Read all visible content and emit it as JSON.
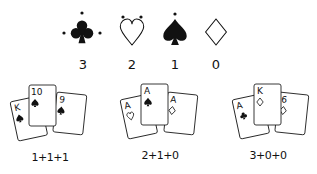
{
  "suits": [
    {
      "name": "clubs",
      "symbol": "♣",
      "filled": true,
      "dots": 3,
      "points": "3"
    },
    {
      "name": "hearts",
      "symbol": "♥",
      "filled": false,
      "dots": 2,
      "points": "2"
    },
    {
      "name": "spades",
      "symbol": "♠",
      "filled": true,
      "dots": 1,
      "points": "1"
    },
    {
      "name": "diamonds",
      "symbol": "♦",
      "filled": false,
      "dots": 0,
      "points": "0"
    }
  ],
  "hands": [
    {
      "label": "1+1+1",
      "cards": [
        {
          "rank": "K",
          "suit": "spades"
        },
        {
          "rank": "10",
          "suit": "spades"
        },
        {
          "rank": "9",
          "suit": "spades"
        }
      ]
    },
    {
      "label": "2+1+0",
      "cards": [
        {
          "rank": "A",
          "suit": "hearts"
        },
        {
          "rank": "A",
          "suit": "spades"
        },
        {
          "rank": "A",
          "suit": "diamonds"
        }
      ]
    },
    {
      "label": "3+0+0",
      "cards": [
        {
          "rank": "A",
          "suit": "clubs"
        },
        {
          "rank": "K",
          "suit": "diamonds"
        },
        {
          "rank": "6",
          "suit": "diamonds"
        }
      ]
    }
  ]
}
